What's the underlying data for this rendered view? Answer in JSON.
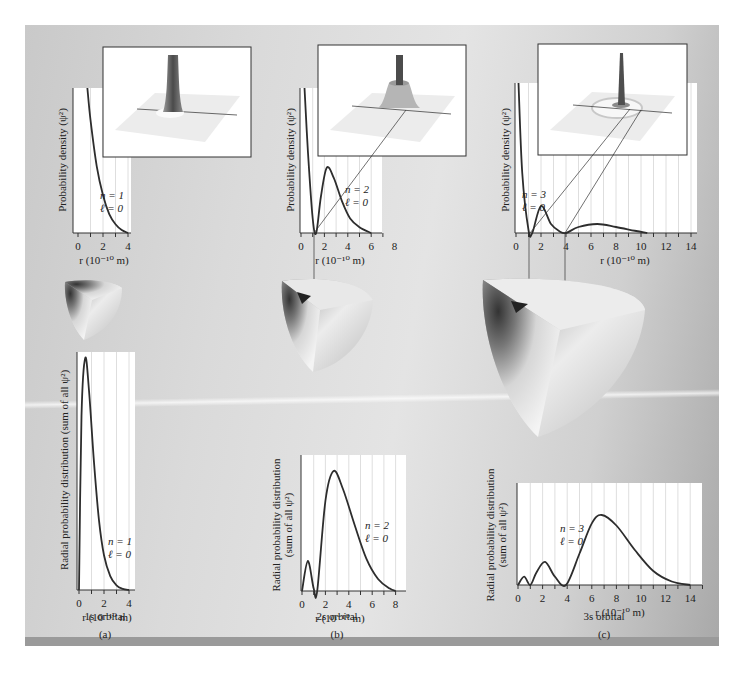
{
  "figure": {
    "panels": [
      {
        "id": "a",
        "label": "(a)",
        "orbital_caption": "1s orbital",
        "n_label": "n = 1",
        "l_label": "ℓ = 0"
      },
      {
        "id": "b",
        "label": "(b)",
        "orbital_caption": "2s orbital",
        "n_label": "n = 2",
        "l_label": "ℓ = 0"
      },
      {
        "id": "c",
        "label": "(c)",
        "orbital_caption": "3s orbital",
        "n_label": "n = 3",
        "l_label": "ℓ = 0"
      }
    ],
    "density_ylabel": "Probability density (ψ²)",
    "radial_ylabel_a": "Radial probability distribution (sum of all ψ²)",
    "radial_ylabel_line1": "Radial probability distribution",
    "radial_ylabel_line2": "(sum of all ψ²)",
    "xlabel": "r (10⁻¹⁰ m)"
  },
  "chart_data": [
    {
      "type": "line",
      "title": "1s probability density",
      "xlabel": "r (10^-10 m)",
      "ylabel": "Probability density (ψ²)",
      "x_ticks": [
        0,
        2,
        4
      ],
      "xlim": [
        0,
        4.5
      ],
      "grid": true,
      "annotation": "n = 1, ℓ = 0",
      "x": [
        0.75,
        1.0,
        1.5,
        2.0,
        2.5,
        3.0,
        3.5,
        4.0
      ],
      "values": [
        1.0,
        0.78,
        0.46,
        0.26,
        0.13,
        0.06,
        0.02,
        0.0
      ]
    },
    {
      "type": "line",
      "title": "2s probability density",
      "xlabel": "r (10^-10 m)",
      "ylabel": "Probability density (ψ²)",
      "x_ticks": [
        0,
        2,
        4,
        6,
        8
      ],
      "xlim": [
        0,
        9
      ],
      "grid": true,
      "annotation": "n = 2, ℓ = 0",
      "x": [
        0.3,
        0.6,
        1.0,
        1.3,
        1.7,
        2.2,
        2.8,
        3.5,
        4.2,
        5.0,
        6.0
      ],
      "values": [
        1.0,
        0.55,
        0.1,
        0.0,
        0.25,
        0.45,
        0.38,
        0.22,
        0.1,
        0.04,
        0.0
      ]
    },
    {
      "type": "line",
      "title": "3s probability density",
      "xlabel": "r (10^-10 m)",
      "ylabel": "Probability density (ψ²)",
      "x_ticks": [
        0,
        2,
        4,
        6,
        8,
        10,
        12,
        14
      ],
      "xlim": [
        0,
        15
      ],
      "grid": true,
      "annotation": "n = 3, ℓ = 0",
      "x": [
        0.2,
        0.5,
        1.0,
        1.3,
        2.0,
        2.8,
        3.5,
        4.0,
        5.0,
        6.5,
        8.0,
        9.5,
        10.5
      ],
      "values": [
        1.0,
        0.4,
        0.02,
        0.0,
        0.18,
        0.06,
        0.01,
        0.0,
        0.04,
        0.06,
        0.04,
        0.015,
        0.0
      ]
    },
    {
      "type": "line",
      "title": "1s radial probability distribution",
      "xlabel": "r (10^-10 m)",
      "ylabel": "Radial probability distribution (sum of all ψ²)",
      "x_ticks": [
        0,
        2,
        4
      ],
      "xlim": [
        0,
        4.5
      ],
      "grid": true,
      "annotation": "n = 1, ℓ = 0",
      "caption": "1s orbital",
      "x": [
        0,
        0.2,
        0.5,
        0.8,
        1.2,
        1.6,
        2.0,
        2.5,
        3.0,
        3.5,
        4.0
      ],
      "values": [
        0.0,
        0.75,
        1.0,
        0.86,
        0.55,
        0.3,
        0.15,
        0.06,
        0.02,
        0.005,
        0.0
      ]
    },
    {
      "type": "line",
      "title": "2s radial probability distribution",
      "xlabel": "r (10^-10 m)",
      "ylabel": "Radial probability distribution (sum of all ψ²)",
      "x_ticks": [
        0,
        2,
        4,
        6,
        8
      ],
      "xlim": [
        0,
        8.5
      ],
      "grid": true,
      "annotation": "n = 2, ℓ = 0",
      "caption": "2s orbital",
      "x": [
        0,
        0.5,
        1.0,
        1.3,
        2.0,
        2.7,
        3.5,
        4.5,
        5.5,
        6.5,
        7.5,
        8.0
      ],
      "values": [
        0.0,
        0.25,
        0.02,
        0.0,
        0.75,
        1.0,
        0.85,
        0.55,
        0.27,
        0.1,
        0.02,
        0.0
      ]
    },
    {
      "type": "line",
      "title": "3s radial probability distribution",
      "xlabel": "r (10^-10 m)",
      "ylabel": "Radial probability distribution (sum of all ψ²)",
      "x_ticks": [
        0,
        2,
        4,
        6,
        8,
        10,
        12,
        14
      ],
      "xlim": [
        0,
        15
      ],
      "grid": true,
      "annotation": "n = 3, ℓ = 0",
      "caption": "3s orbital",
      "x": [
        0,
        0.5,
        1.0,
        1.5,
        2.2,
        3.0,
        3.9,
        5.0,
        6.0,
        6.8,
        8.0,
        9.5,
        11.0,
        12.5,
        14.0
      ],
      "values": [
        0.0,
        0.12,
        0.0,
        0.18,
        0.33,
        0.12,
        0.0,
        0.45,
        0.88,
        1.0,
        0.85,
        0.5,
        0.2,
        0.05,
        0.0
      ]
    }
  ]
}
